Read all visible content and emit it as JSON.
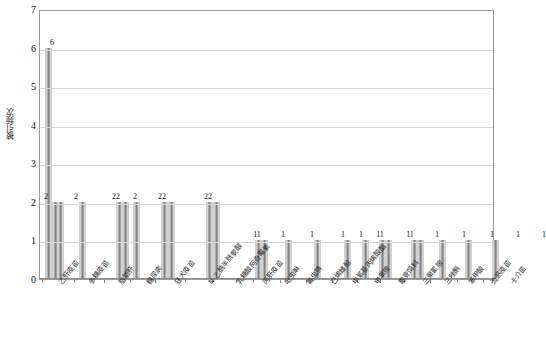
{
  "chart_data": {
    "type": "bar",
    "title": "",
    "xlabel": "",
    "ylabel": "被引频次",
    "ylim": [
      0,
      7
    ],
    "ytick_values": [
      0,
      1,
      2,
      3,
      4,
      5,
      6,
      7
    ],
    "ytick_labels": [
      "0",
      "1",
      "2",
      "3",
      "4",
      "5",
      "6",
      "7"
    ],
    "grid": true,
    "legend": "none",
    "categories": [
      "乙肝疫苗",
      "多糖疫苗",
      "脂肪肝",
      "糖尿病",
      "狂犬疫苗",
      "N-乙酰半胱氨酸",
      "乳糖酸阿奇霉素",
      "丙肝疫苗",
      "吡虫啉",
      "氟虫腈",
      "己烯雌酚",
      "甲氧基丙烯酸酯",
      "甲苯胺",
      "霉变饲料",
      "三聚氰胺",
      "三唑酮",
      "苯甲酸",
      "流感疫苗",
      "卡介苗"
    ],
    "values": [
      2,
      2,
      2,
      2,
      2,
      2,
      2,
      2,
      1,
      1,
      1,
      1,
      1,
      1,
      1,
      1,
      1,
      1,
      1
    ],
    "bar_values_flat": [
      6,
      2,
      2,
      2,
      2,
      2,
      2,
      2,
      2,
      1,
      1,
      1,
      1,
      1,
      1,
      1,
      1,
      1,
      1,
      1,
      1,
      1,
      1,
      1,
      1,
      1,
      1,
      1,
      1,
      1,
      1,
      1,
      1,
      1,
      1
    ],
    "data_labels": [
      {
        "text": "6",
        "x": 12,
        "value": 6
      },
      {
        "text": "2",
        "x": 6,
        "value": 2
      },
      {
        "text": "2",
        "x": 36,
        "value": 2
      },
      {
        "text": "22",
        "x": 76,
        "value": 2
      },
      {
        "text": "2",
        "x": 95,
        "value": 2
      },
      {
        "text": "22",
        "x": 122,
        "value": 2
      },
      {
        "text": "22",
        "x": 168,
        "value": 2
      },
      {
        "text": "11",
        "x": 217,
        "value": 1
      },
      {
        "text": "1",
        "x": 243,
        "value": 1
      },
      {
        "text": "1",
        "x": 272,
        "value": 1
      },
      {
        "text": "1",
        "x": 303,
        "value": 1
      },
      {
        "text": "1",
        "x": 321,
        "value": 1
      },
      {
        "text": "11",
        "x": 340,
        "value": 1
      },
      {
        "text": "11",
        "x": 370,
        "value": 1
      },
      {
        "text": "1",
        "x": 397,
        "value": 1
      },
      {
        "text": "1",
        "x": 424,
        "value": 1
      },
      {
        "text": "1",
        "x": 452,
        "value": 1
      },
      {
        "text": "1",
        "x": 478,
        "value": 1
      },
      {
        "text": "1",
        "x": 504,
        "value": 1
      }
    ]
  },
  "axis": {
    "y_title": "被引频次"
  }
}
